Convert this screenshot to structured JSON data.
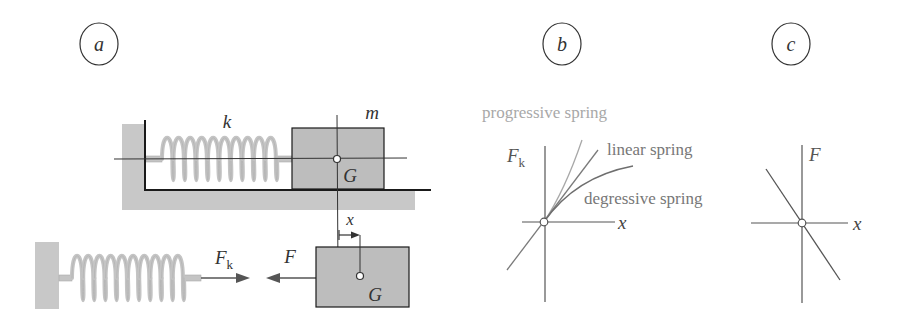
{
  "panels": {
    "a": {
      "label": "a",
      "spring_label": "k",
      "mass_label": "m",
      "center_of_gravity_label": "G",
      "displacement_label": "x",
      "spring_force_label": "F",
      "spring_force_subscript": "k",
      "applied_force_label": "F",
      "free_body_cog_label": "G"
    },
    "b": {
      "label": "b",
      "y_axis_label": "F",
      "y_axis_subscript": "k",
      "x_axis_label": "x",
      "curves": [
        {
          "name": "progressive spring",
          "color": "#a8a8a8"
        },
        {
          "name": "linear spring",
          "color": "#7a7a7a"
        },
        {
          "name": "degressive spring",
          "color": "#6e6e6e"
        }
      ]
    },
    "c": {
      "label": "c",
      "y_axis_label": "F",
      "x_axis_label": "x"
    }
  },
  "colors": {
    "gray_fill": "#c8c8c8",
    "block_fill": "#bdbdbd",
    "spring_coil": "#c4c4c4",
    "line_dark": "#1a1a1a",
    "line_mid": "#555555",
    "text_label": "#777777",
    "text_light": "#a8a8a8"
  }
}
